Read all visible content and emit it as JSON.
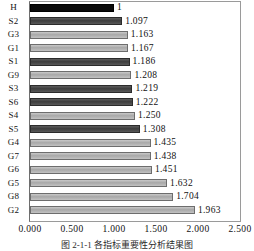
{
  "chart_data": {
    "type": "bar",
    "orientation": "horizontal",
    "title": "",
    "xlabel": "",
    "ylabel": "",
    "xlim": [
      0.0,
      2.5
    ],
    "grid": false,
    "legend": "none",
    "tick_labels": [
      "0.000",
      "0.500",
      "1.000",
      "1.500",
      "2.000",
      "2.500"
    ],
    "tick_values": [
      0.0,
      0.5,
      1.0,
      1.5,
      2.0,
      2.5
    ],
    "categories": [
      "H",
      "S2",
      "G3",
      "G1",
      "S1",
      "G9",
      "S3",
      "S6",
      "S4",
      "S5",
      "G4",
      "G7",
      "G6",
      "G5",
      "G8",
      "G2"
    ],
    "values": [
      1,
      1.097,
      1.163,
      1.167,
      1.186,
      1.208,
      1.219,
      1.222,
      1.25,
      1.308,
      1.435,
      1.438,
      1.451,
      1.632,
      1.704,
      1.963
    ],
    "value_labels": [
      "1",
      "1.097",
      "1.163",
      "1.167",
      "1.186",
      "1.208",
      "1.219",
      "1.222",
      "1.250",
      "1.308",
      "1.435",
      "1.438",
      "1.451",
      "1.632",
      "1.704",
      "1.963"
    ],
    "bar_shades": [
      "black",
      "dark",
      "light",
      "light",
      "dark",
      "light",
      "dark",
      "dark",
      "light",
      "dark",
      "light",
      "light",
      "light",
      "light",
      "light",
      "light"
    ]
  },
  "caption": {
    "text": "图 2-1-1  各指标重要性分析结果图"
  },
  "colors": {
    "bar_black": "#0a0a0a",
    "bar_dark": "#3d3d3d",
    "bar_light": "#a8a8a8",
    "frame": "#9a9a9a",
    "text": "#111111"
  }
}
